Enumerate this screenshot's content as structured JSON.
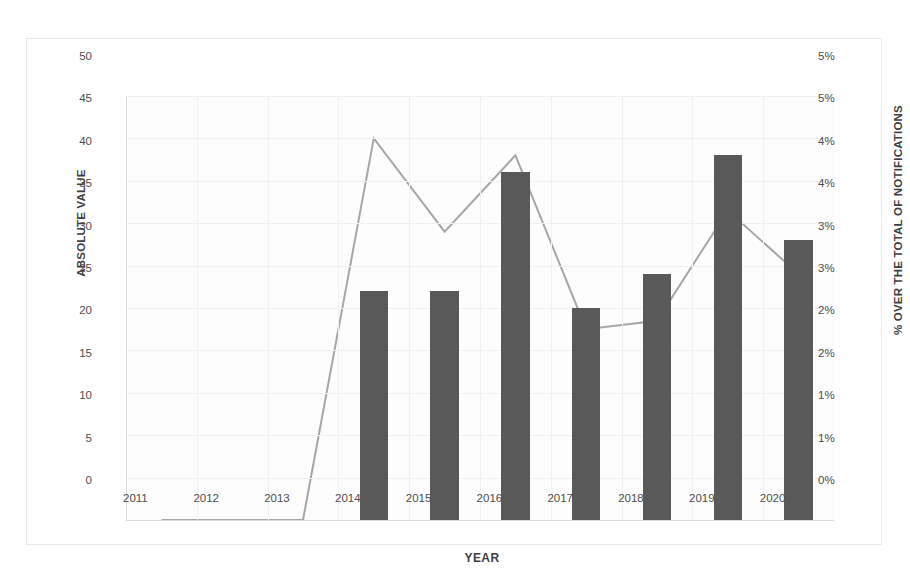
{
  "chart_data": {
    "type": "bar",
    "title": "",
    "xlabel": "YEAR",
    "categories": [
      "2011",
      "2012",
      "2013",
      "2014",
      "2015",
      "2016",
      "2017",
      "2018",
      "2019",
      "2020"
    ],
    "grid": true,
    "legend": "none",
    "series": [
      {
        "name": "Absolute value",
        "type": "bar",
        "axis": "left",
        "color": "#595959",
        "values": [
          0,
          0,
          0,
          27,
          27,
          41,
          25,
          29,
          43,
          33
        ]
      },
      {
        "name": "% over the total of notifications",
        "type": "line",
        "axis": "right",
        "color": "#a6a6a6",
        "values": [
          0,
          0,
          0,
          4.5,
          3.4,
          4.3,
          2.25,
          2.35,
          3.65,
          2.9
        ]
      }
    ],
    "axes": {
      "left": {
        "label": "ABSOLUTE VALUE",
        "min": 0,
        "max": 50,
        "step": 5,
        "ticks": [
          "0",
          "5",
          "10",
          "15",
          "20",
          "25",
          "30",
          "35",
          "40",
          "45",
          "50"
        ]
      },
      "right": {
        "label": "% OVER THE TOTAL OF NOTIFICATIONS",
        "min": 0,
        "max": 5,
        "step": 0.5,
        "ticks": [
          "0%",
          "1%",
          "1%",
          "2%",
          "2%",
          "3%",
          "3%",
          "4%",
          "4%",
          "5%",
          "5%"
        ]
      }
    }
  }
}
